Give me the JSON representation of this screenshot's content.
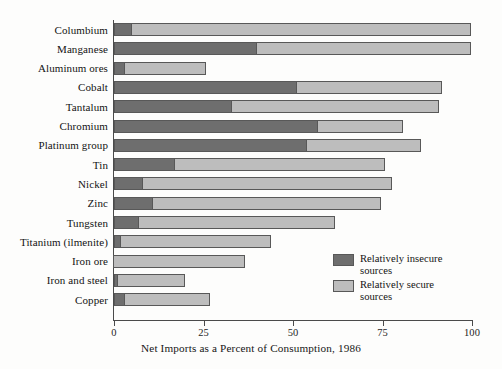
{
  "chart_data": {
    "type": "bar",
    "orientation": "horizontal",
    "stacked": true,
    "title": "",
    "xlabel": "Net Imports as a Percent of Consumption, 1986",
    "ylabel": "",
    "xlim": [
      0,
      100
    ],
    "xticks": [
      0,
      25,
      50,
      75,
      100
    ],
    "xtick_labels": [
      "0",
      "25",
      "50",
      "75",
      "100"
    ],
    "grid": false,
    "legend_position": "inside-lower-right",
    "categories": [
      "Columbium",
      "Manganese",
      "Aluminum ores",
      "Cobalt",
      "Tantalum",
      "Chromium",
      "Platinum group",
      "Tin",
      "Nickel",
      "Zinc",
      "Tungsten",
      "Titanium (ilmenite)",
      "Iron ore",
      "Iron and steel",
      "Copper"
    ],
    "series": [
      {
        "name": "Relatively insecure sources",
        "color": "#6e6e6e",
        "values": [
          5,
          40,
          3,
          51,
          33,
          57,
          54,
          17,
          8,
          11,
          7,
          2,
          0,
          1,
          3
        ]
      },
      {
        "name": "Relatively secure sources",
        "color": "#bdbdbd",
        "values": [
          95,
          60,
          23,
          41,
          58,
          24,
          32,
          59,
          70,
          64,
          55,
          42,
          37,
          19,
          24
        ]
      }
    ],
    "totals": [
      100,
      100,
      26,
      92,
      91,
      81,
      86,
      76,
      78,
      75,
      62,
      44,
      37,
      20,
      27
    ]
  },
  "legend": {
    "entries": [
      {
        "label": "Relatively insecure\nsources",
        "swatch": "insecure"
      },
      {
        "label": "Relatively secure\nsources",
        "swatch": "secure"
      }
    ]
  }
}
